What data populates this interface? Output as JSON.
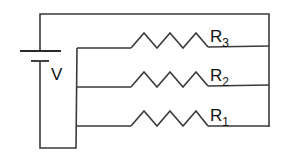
{
  "diagram": {
    "type": "parallel-resistor-circuit",
    "source": {
      "label": "V",
      "symbol": "battery-icon"
    },
    "resistors": [
      {
        "name": "R",
        "subscript": "3",
        "position": "top"
      },
      {
        "name": "R",
        "subscript": "2",
        "position": "middle"
      },
      {
        "name": "R",
        "subscript": "1",
        "position": "bottom"
      }
    ],
    "colors": {
      "wire": "#3a3a3a",
      "text": "#111111",
      "background": "#ffffff"
    }
  }
}
